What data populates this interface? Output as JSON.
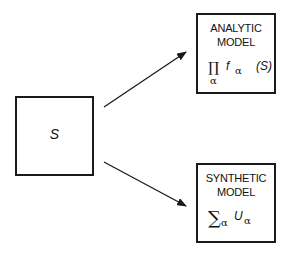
{
  "nodes": {
    "source": {
      "label": "S"
    },
    "analytic": {
      "title_line1": "ANALYTIC",
      "title_line2": "MODEL",
      "formula": {
        "operator": "∏",
        "operator_sub": "α",
        "func": "f",
        "func_sub": "α",
        "arg": "(S)"
      }
    },
    "synthetic": {
      "title_line1": "SYNTHETIC",
      "title_line2": "MODEL",
      "formula": {
        "operator": "∑",
        "operator_sub": "α",
        "func": "U",
        "func_sub": "α"
      }
    }
  },
  "edges": [
    {
      "from": "source",
      "to": "analytic"
    },
    {
      "from": "source",
      "to": "synthetic"
    }
  ],
  "colors": {
    "stroke": "#1a1a1a",
    "background": "#ffffff"
  }
}
